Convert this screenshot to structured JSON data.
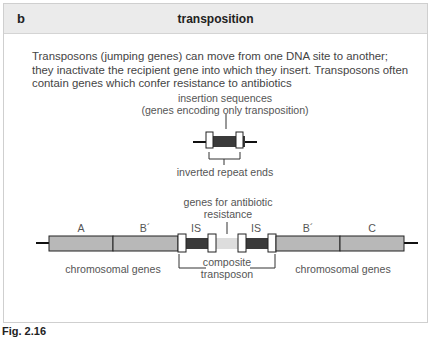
{
  "panel": {
    "letter": "b",
    "title": "transposition",
    "description": "Transposons (jumping genes) can move from one DNA site to another; they inactivate the recipient gene into which they insert. Transposons often contain genes which confer resistance to antibiotics"
  },
  "top_diagram": {
    "label_line1": "insertion sequences",
    "label_line2": "(genes encoding only transposition)",
    "bottom_label": "inverted repeat ends"
  },
  "bottom_diagram": {
    "antibiotic_label_line1": "genes for antibiotic",
    "antibiotic_label_line2": "resistance",
    "segments": [
      "A",
      "B´",
      "IS",
      "IS",
      "B´",
      "C"
    ],
    "left_label": "chromosomal genes",
    "right_label": "chromosomal genes",
    "composite_line1": "composite",
    "composite_line2": "transposon"
  },
  "colors": {
    "header_bg": "#ebebeb",
    "gene_fill": "#b8b8b8",
    "is_fill": "#3a3a3a",
    "resistance_fill": "#dddddd"
  },
  "caption": "Fig. 2.16"
}
